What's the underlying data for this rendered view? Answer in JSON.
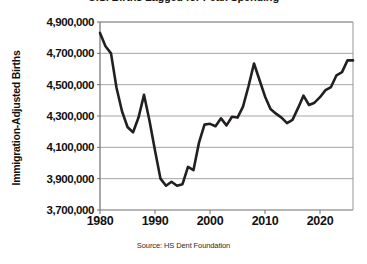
{
  "chart_data": {
    "type": "line",
    "title": "U.S. Births Lagged for Peak Spending",
    "subtitle": "",
    "xlabel": "",
    "ylabel": "Immigration-Adjusted Births",
    "source": "Source: HS Dent Foundation",
    "xlim": [
      1980,
      2026
    ],
    "ylim": [
      3700000,
      4900000
    ],
    "grid": true,
    "legend": false,
    "legend_position": "none",
    "line_color": "#231f20",
    "grid_color": "#9a9a9a",
    "axis_color": "#8c8c8c",
    "background_color": "#ffffff",
    "xticks": [
      1980,
      1990,
      2000,
      2010,
      2020
    ],
    "xtick_labels": [
      "1980",
      "1990",
      "2000",
      "2010",
      "2020"
    ],
    "yticks": [
      3700000,
      3900000,
      4100000,
      4300000,
      4500000,
      4700000,
      4900000
    ],
    "ytick_labels": [
      "3,700,000",
      "3,900,000",
      "4,100,000",
      "4,300,000",
      "4,500,000",
      "4,700,000",
      "4,900,000"
    ],
    "x": [
      1980,
      1981,
      1982,
      1983,
      1984,
      1985,
      1986,
      1987,
      1988,
      1989,
      1990,
      1991,
      1992,
      1993,
      1994,
      1995,
      1996,
      1997,
      1998,
      1999,
      2000,
      2001,
      2002,
      2003,
      2004,
      2005,
      2006,
      2007,
      2008,
      2009,
      2010,
      2011,
      2012,
      2013,
      2014,
      2015,
      2016,
      2017,
      2018,
      2019,
      2020,
      2021,
      2022,
      2023,
      2024,
      2025,
      2026
    ],
    "values": [
      4830000,
      4745000,
      4700000,
      4480000,
      4330000,
      4230000,
      4195000,
      4290000,
      4435000,
      4270000,
      4080000,
      3900000,
      3855000,
      3880000,
      3855000,
      3865000,
      3975000,
      3955000,
      4130000,
      4245000,
      4250000,
      4235000,
      4285000,
      4240000,
      4295000,
      4290000,
      4360000,
      4490000,
      4635000,
      4530000,
      4425000,
      4345000,
      4315000,
      4290000,
      4255000,
      4275000,
      4350000,
      4430000,
      4370000,
      4385000,
      4420000,
      4465000,
      4485000,
      4560000,
      4580000,
      4655000,
      4655000
    ],
    "series": [
      {
        "name": "Immigration-Adjusted Births",
        "values": [
          4830000,
          4745000,
          4700000,
          4480000,
          4330000,
          4230000,
          4195000,
          4290000,
          4435000,
          4270000,
          4080000,
          3900000,
          3855000,
          3880000,
          3855000,
          3865000,
          3975000,
          3955000,
          4130000,
          4245000,
          4250000,
          4235000,
          4285000,
          4240000,
          4295000,
          4290000,
          4360000,
          4490000,
          4635000,
          4530000,
          4425000,
          4345000,
          4315000,
          4290000,
          4255000,
          4275000,
          4350000,
          4430000,
          4370000,
          4385000,
          4420000,
          4465000,
          4485000,
          4560000,
          4580000,
          4655000,
          4655000
        ]
      }
    ],
    "annotations": []
  }
}
